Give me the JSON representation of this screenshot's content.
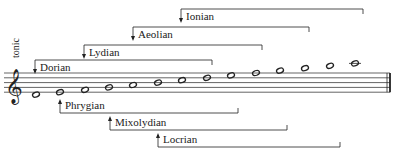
{
  "diagram": {
    "tonic_label": "tonic",
    "clef": "treble",
    "staff": {
      "top": 73,
      "spacing": 4.8,
      "left": 4,
      "right": 390
    },
    "notes": [
      {
        "pitch": "D4",
        "x": 36
      },
      {
        "pitch": "E4",
        "x": 60
      },
      {
        "pitch": "F4",
        "x": 85
      },
      {
        "pitch": "G4",
        "x": 109
      },
      {
        "pitch": "A4",
        "x": 133
      },
      {
        "pitch": "B4",
        "x": 158
      },
      {
        "pitch": "C5",
        "x": 182
      },
      {
        "pitch": "D5",
        "x": 207
      },
      {
        "pitch": "E5",
        "x": 231
      },
      {
        "pitch": "F5",
        "x": 256
      },
      {
        "pitch": "G5",
        "x": 280
      },
      {
        "pitch": "A5",
        "x": 305
      },
      {
        "pitch": "B5",
        "x": 330
      },
      {
        "pitch": "C6",
        "x": 355
      }
    ],
    "modes_above": [
      {
        "name": "Ionian",
        "x1": 181,
        "x2": 363,
        "y": 9
      },
      {
        "name": "Aeolian",
        "x1": 133,
        "x2": 309,
        "y": 27
      },
      {
        "name": "Lydian",
        "x1": 84,
        "x2": 262,
        "y": 45
      },
      {
        "name": "Dorian",
        "x1": 35,
        "x2": 212,
        "y": 60
      }
    ],
    "modes_below": [
      {
        "name": "Phrygian",
        "x1": 60,
        "x2": 238,
        "y": 113
      },
      {
        "name": "Mixolydian",
        "x1": 110,
        "x2": 287,
        "y": 130
      },
      {
        "name": "Locrian",
        "x1": 158,
        "x2": 340,
        "y": 147
      }
    ],
    "colors": {
      "ink": "#222222",
      "background": "#ffffff"
    }
  }
}
